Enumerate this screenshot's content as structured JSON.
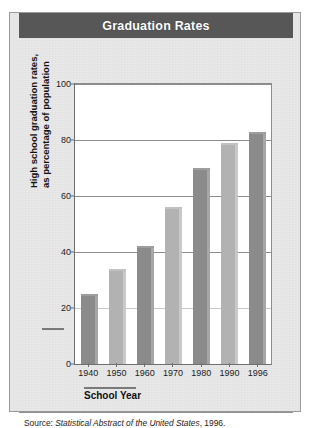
{
  "figure": {
    "title": "Graduation Rates",
    "x_axis_title": "School Year",
    "y_axis_title_line1": "High school graduation rates,",
    "y_axis_title_line2": "as percentage of population",
    "source_prefix": "Source:",
    "source_italic": "Statistical Abstract of the United States",
    "source_suffix": ", 1996."
  },
  "chart_data": {
    "type": "bar",
    "title": "Graduation Rates",
    "xlabel": "School Year",
    "ylabel": "High school graduation rates, as percentage of population",
    "categories": [
      "1940",
      "1950",
      "1960",
      "1970",
      "1980",
      "1990",
      "1996"
    ],
    "values": [
      25,
      34,
      42,
      56,
      70,
      79,
      83
    ],
    "ylim": [
      0,
      100
    ],
    "yticks": [
      "0",
      "20",
      "40",
      "60",
      "80",
      "100"
    ],
    "grid": "horizontal",
    "legend": "none",
    "bar_colors": [
      "#8b8b8b",
      "#b2b2b2",
      "#8b8b8b",
      "#b2b2b2",
      "#8b8b8b",
      "#b2b2b2",
      "#8b8b8b"
    ]
  },
  "colors": {
    "title_bar": "#575757",
    "panel": "#e9e9e9",
    "plot_background": "#ffffff",
    "axis": "#6f6f6f",
    "bar_dark": "#8b8b8b",
    "bar_light": "#b2b2b2"
  }
}
